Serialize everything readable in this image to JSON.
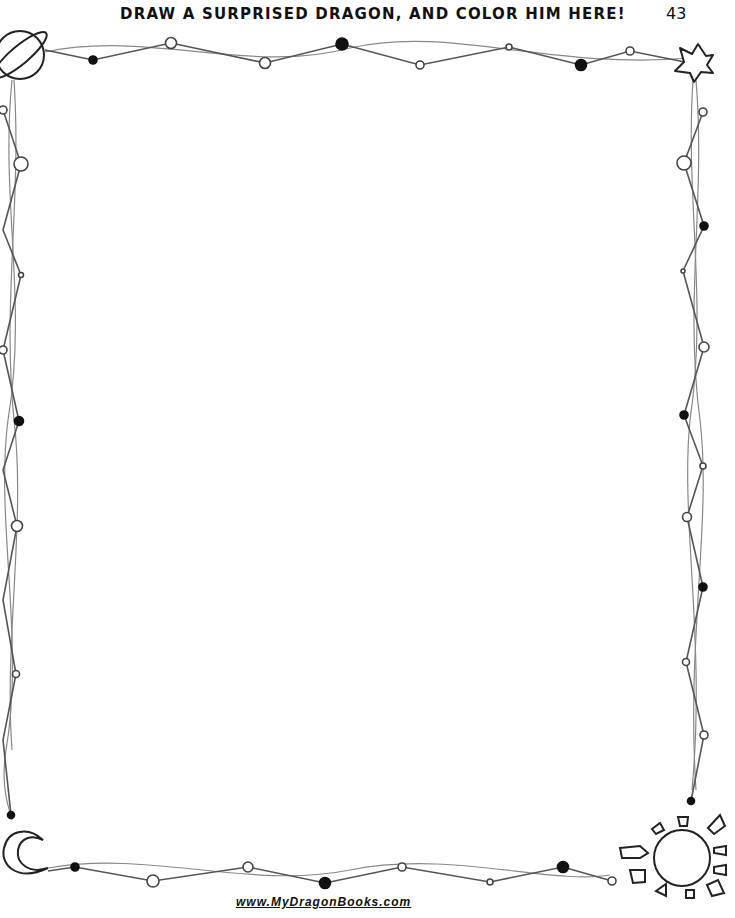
{
  "header": {
    "title": "DRAW A SURPRISED DRAGON, AND COLOR HIM HERE!",
    "page_number": "43"
  },
  "footer": {
    "website": "www.MyDragonBooks.com"
  },
  "border": {
    "corner_icons": {
      "top_left": "planet-icon",
      "top_right": "star-icon",
      "bottom_left": "crescent-moon-icon",
      "bottom_right": "sun-icon"
    },
    "line_color": "#444444",
    "background": "#ffffff"
  },
  "drawing_area": {
    "content": ""
  }
}
